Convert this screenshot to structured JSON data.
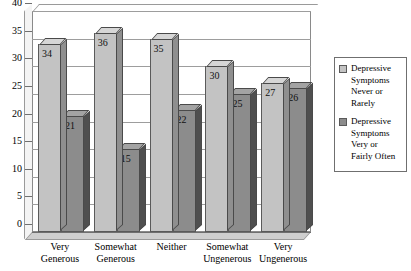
{
  "chart_data": {
    "type": "bar",
    "title": "",
    "xlabel": "",
    "ylabel": "",
    "ylim": [
      0,
      40
    ],
    "ytick_step": 5,
    "yticks": [
      "40",
      "35",
      "30",
      "25",
      "20",
      "15",
      "10",
      "5",
      "0"
    ],
    "grid": true,
    "legend_position": "right",
    "style": "3d-column",
    "categories": [
      "Very Generous",
      "Somewhat Generous",
      "Neither",
      "Somewhat Ungenerous",
      "Very Ungenerous"
    ],
    "category_lines": [
      [
        "Very",
        "Generous"
      ],
      [
        "Somewhat",
        "Generous"
      ],
      [
        "Neither",
        ""
      ],
      [
        "Somewhat",
        "Ungenerous"
      ],
      [
        "Very",
        "Ungenerous"
      ]
    ],
    "series": [
      {
        "name": "Depressive Symptoms Never or Rarely",
        "name_lines": [
          "Depressive",
          "Symptoms",
          "Never or",
          "Rarely"
        ],
        "color": "#c3c3c3",
        "values": [
          34,
          36,
          35,
          30,
          27
        ]
      },
      {
        "name": "Depressive Symptoms Very or Fairly Often",
        "name_lines": [
          "Depressive",
          "Symptoms",
          "Very or",
          "Fairly Often"
        ],
        "color": "#8c8c8c",
        "values": [
          21,
          15,
          22,
          25,
          26
        ]
      }
    ]
  }
}
